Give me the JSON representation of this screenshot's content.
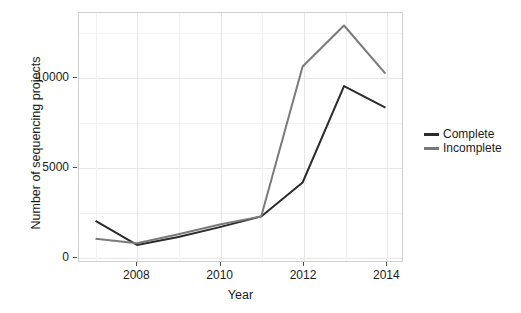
{
  "chart_data": {
    "type": "line",
    "title": "",
    "xlabel": "Year",
    "ylabel": "Number of sequencing projects",
    "x": [
      2007,
      2008,
      2009,
      2010,
      2011,
      2012,
      2013,
      2014
    ],
    "xlim": [
      2006.6,
      2014.4
    ],
    "ylim": [
      -300,
      13600
    ],
    "xticks": [
      2008,
      2010,
      2012,
      2014
    ],
    "xtick_labels": [
      "2008",
      "2010",
      "2012",
      "2014"
    ],
    "yticks": [
      0,
      5000,
      10000
    ],
    "ytick_labels": [
      "0",
      "5000",
      "10000"
    ],
    "grid": true,
    "legend_position": "right",
    "series": [
      {
        "name": "Complete",
        "color": "#2b2b2b",
        "values": [
          1950,
          600,
          1050,
          1600,
          2200,
          4100,
          9500,
          8300
        ]
      },
      {
        "name": "Incomplete",
        "color": "#7a7a7a",
        "values": [
          950,
          700,
          1200,
          1750,
          2200,
          10600,
          12900,
          10200
        ]
      }
    ]
  },
  "legend": {
    "items": [
      {
        "label": "Complete",
        "color": "#2b2b2b"
      },
      {
        "label": "Incomplete",
        "color": "#7a7a7a"
      }
    ]
  },
  "axes": {
    "x_title": "Year",
    "y_title": "Number of sequencing projects"
  }
}
